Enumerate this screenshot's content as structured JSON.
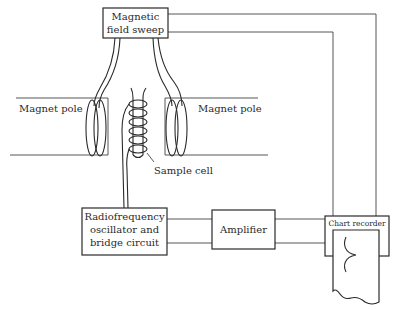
{
  "diagram": {
    "labels": {
      "sweep_line1": "Magnetic",
      "sweep_line2": "field sweep",
      "left_pole": "Magnet pole",
      "right_pole": "Magnet pole",
      "sample_cell": "Sample cell",
      "rf_line1": "Radiofrequency",
      "rf_line2": "oscillator and",
      "rf_line3": "bridge circuit",
      "amplifier": "Amplifier",
      "chart_recorder": "Chart recorder"
    },
    "components": [
      {
        "id": "magnetic-field-sweep",
        "label": "Magnetic field sweep"
      },
      {
        "id": "magnet-pole-left",
        "label": "Magnet pole"
      },
      {
        "id": "magnet-pole-right",
        "label": "Magnet pole"
      },
      {
        "id": "sample-cell",
        "label": "Sample cell"
      },
      {
        "id": "rf-oscillator",
        "label": "Radiofrequency oscillator and bridge circuit"
      },
      {
        "id": "amplifier",
        "label": "Amplifier"
      },
      {
        "id": "chart-recorder",
        "label": "Chart recorder"
      }
    ],
    "connections": [
      {
        "from": "magnetic-field-sweep",
        "to": "magnet-pole-left"
      },
      {
        "from": "magnetic-field-sweep",
        "to": "magnet-pole-right"
      },
      {
        "from": "magnetic-field-sweep",
        "to": "chart-recorder"
      },
      {
        "from": "sample-cell",
        "to": "rf-oscillator"
      },
      {
        "from": "rf-oscillator",
        "to": "amplifier"
      },
      {
        "from": "amplifier",
        "to": "chart-recorder"
      }
    ],
    "colors": {
      "line": "#2a2a2a",
      "background": "#ffffff"
    }
  }
}
